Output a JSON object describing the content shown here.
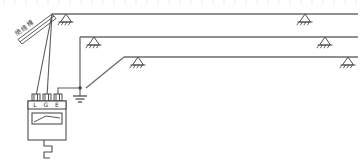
{
  "figure": {
    "background_color": "#ffffff",
    "line_color": "#5a5a5a",
    "width": 364,
    "height": 164
  },
  "labels": {
    "insulating_rod": "绝缘棒"
  },
  "instrument": {
    "name": "megohmmeter",
    "terminals": [
      {
        "id": "L",
        "label": "L"
      },
      {
        "id": "G",
        "label": "G"
      },
      {
        "id": "E",
        "label": "E"
      }
    ],
    "terminal_strip_text": "LGE",
    "has_crank_handle": true,
    "has_scale_window": true
  },
  "conductors": [
    {
      "id": "line-1",
      "label": "",
      "y": 14,
      "x_start": 52,
      "x_end": 358
    },
    {
      "id": "line-2",
      "label": "",
      "y": 37,
      "x_start": 80,
      "x_end": 358
    },
    {
      "id": "line-3",
      "label": "",
      "y": 57,
      "x_start": 124,
      "x_end": 358
    }
  ],
  "supports": [
    {
      "id": "support-left-1",
      "x": 66,
      "y": 14
    },
    {
      "id": "support-left-2",
      "x": 94,
      "y": 37
    },
    {
      "id": "support-left-3",
      "x": 138,
      "y": 57
    },
    {
      "id": "support-right-1",
      "x": 305,
      "y": 14
    },
    {
      "id": "support-right-2",
      "x": 325,
      "y": 37
    },
    {
      "id": "support-right-3",
      "x": 348,
      "y": 57
    }
  ],
  "earth": {
    "node_label": "",
    "symbol": "earth-ground",
    "x": 78,
    "y": 88
  },
  "leads": [
    {
      "id": "lead-line-to-bus",
      "from": "L-terminal",
      "to": "conductor-1"
    },
    {
      "id": "lead-guard",
      "from": "G-terminal",
      "to": "conductor-1"
    },
    {
      "id": "lead-earth",
      "from": "E-terminal",
      "to": "earth-node"
    },
    {
      "id": "lead-earth-to-line3",
      "from": "earth-node",
      "to": "conductor-3"
    }
  ]
}
